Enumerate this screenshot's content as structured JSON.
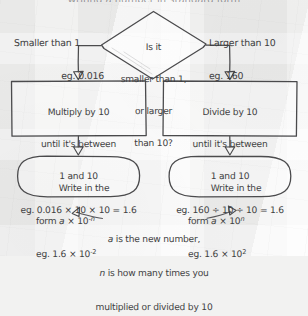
{
  "page": {
    "ink_color": "#4b4b4d",
    "text_color": "#3f3f42",
    "paper_color": "#f3f3f2"
  },
  "cut_off_header": "writing a number in standard form",
  "decision": {
    "line1": "Is it",
    "line2": "smaller than 1,",
    "line3": "or larger",
    "line4": "than 10?"
  },
  "branches": {
    "left": {
      "label": "Smaller than 1",
      "example": "eg. 0.016"
    },
    "right": {
      "label": "Larger than 10",
      "example": "eg. 160"
    }
  },
  "process": {
    "left": {
      "line1": "Multiply by 10",
      "line2": "until it's between",
      "line3": "1 and 10",
      "example": "eg. 0.016 × 10 × 10 = 1.6"
    },
    "right": {
      "line1": "Divide by 10",
      "line2": "until it's between",
      "line3": "1 and 10",
      "example": "eg. 160 ÷ 10 ÷ 10 = 1.6"
    }
  },
  "outcome": {
    "left": {
      "line1": "Write in the",
      "form_prefix": "form ",
      "form_var": "a",
      "form_mid": " × 10",
      "form_exp": "-n",
      "example_prefix": "eg. 1.6 × 10",
      "example_exp": "-2"
    },
    "right": {
      "line1": "Write in the",
      "form_prefix": "form ",
      "form_var": "a",
      "form_mid": " × 10",
      "form_exp": "n",
      "example_prefix": "eg. 1.6 × 10",
      "example_exp": "2"
    }
  },
  "caption": {
    "var_a": "a",
    "line1_rest": " is the new number,",
    "var_n": "n",
    "line2_rest": " is how many times you",
    "line3": "multiplied or divided by 10"
  }
}
